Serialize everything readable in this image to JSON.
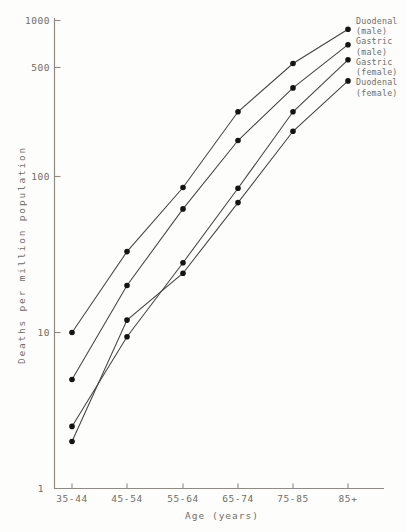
{
  "figure": {
    "kind": "scanned-journal-figure",
    "colors": {
      "background": "#fdfdfc",
      "axis": "#8f8b82",
      "text": "#716e66",
      "line": "#45443f",
      "point": "#141414"
    }
  },
  "chart_data": {
    "type": "line",
    "y_scale": "log",
    "title": "",
    "xlabel": "Age (years)",
    "ylabel": "Deaths per million population",
    "categories": [
      "35-44",
      "45-54",
      "55-64",
      "65-74",
      "75-85",
      "85+"
    ],
    "y_ticks": [
      1000,
      500,
      100,
      10,
      1
    ],
    "y_tick_labels": [
      "1000",
      "500",
      "100",
      "10",
      "1"
    ],
    "ylim": [
      1,
      1000
    ],
    "grid": false,
    "marker": "filled-circle",
    "legend_position": "top-right",
    "series": [
      {
        "name": "Duodenal (male)",
        "legend_lines": [
          "Duodenal",
          "(male)"
        ],
        "values": [
          10,
          33,
          85,
          260,
          530,
          880
        ]
      },
      {
        "name": "Gastric (male)",
        "legend_lines": [
          "Gastric",
          "(male)"
        ],
        "values": [
          5,
          20,
          62,
          170,
          370,
          700
        ]
      },
      {
        "name": "Gastric (female)",
        "legend_lines": [
          "Gastric",
          "(female)"
        ],
        "values": [
          2.5,
          9.4,
          28,
          84,
          260,
          560
        ]
      },
      {
        "name": "Duodenal (female)",
        "legend_lines": [
          "Duodenal",
          "(female)"
        ],
        "values": [
          2,
          12,
          24,
          68,
          195,
          410
        ]
      }
    ]
  }
}
